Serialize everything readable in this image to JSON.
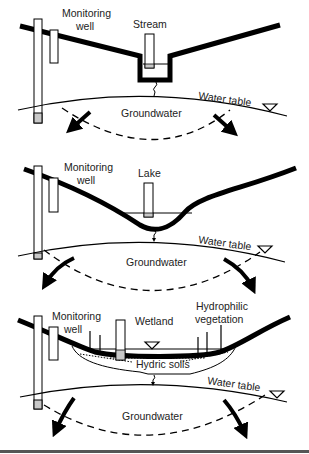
{
  "panels": [
    {
      "name": "stream",
      "labels": {
        "monitoring_well_1": "Monitoring",
        "monitoring_well_2": "well",
        "feature": "Stream",
        "water_table": "Water table",
        "groundwater": "Groundwater"
      }
    },
    {
      "name": "lake",
      "labels": {
        "monitoring_well_1": "Monitoring",
        "monitoring_well_2": "well",
        "feature": "Lake",
        "water_table": "Water table",
        "groundwater": "Groundwater"
      }
    },
    {
      "name": "wetland",
      "labels": {
        "monitoring_well_1": "Monitoring",
        "monitoring_well_2": "well",
        "feature": "Wetland",
        "vegetation_1": "Hydrophilic",
        "vegetation_2": "vegetation",
        "soils": "Hydric soils",
        "water_table": "Water table",
        "groundwater": "Groundwater"
      }
    }
  ],
  "colors": {
    "line": "#000000",
    "well_fill": "#ffffff",
    "well_screen": "#c8c8c8",
    "rule": "#555555"
  }
}
